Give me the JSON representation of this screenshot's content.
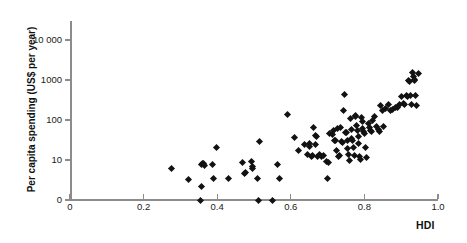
{
  "chart_data": {
    "type": "scatter",
    "title": "",
    "xlabel": "HDI",
    "ylabel": "Per capita spending (US$ per year)",
    "xlim": [
      0,
      1.0
    ],
    "ylim": [
      0,
      10000
    ],
    "yscale": "log-with-zero-baseline",
    "grid": false,
    "legend": null,
    "xticks": [
      "0",
      "0.2",
      "0.4",
      "0.6",
      "0.8",
      "1.0"
    ],
    "xtick_values": [
      0,
      0.2,
      0.4,
      0.6,
      0.8,
      1.0
    ],
    "yticks": [
      "0",
      "10",
      "100",
      "1000",
      "10 000"
    ],
    "ytick_values": [
      0,
      10,
      100,
      1000,
      10000
    ],
    "marker": "filled-diamond",
    "marker_color": "#121212",
    "axis_color": "#8c8c8c",
    "n_points": 120,
    "points": [
      {
        "x": 0.276,
        "y": 6.3
      },
      {
        "x": 0.322,
        "y": 3.3
      },
      {
        "x": 0.355,
        "y": 0
      },
      {
        "x": 0.357,
        "y": 7.6
      },
      {
        "x": 0.36,
        "y": 8.0
      },
      {
        "x": 0.364,
        "y": 8.2
      },
      {
        "x": 0.366,
        "y": 7.4
      },
      {
        "x": 0.357,
        "y": 2.2
      },
      {
        "x": 0.388,
        "y": 7.7
      },
      {
        "x": 0.391,
        "y": 3.4
      },
      {
        "x": 0.398,
        "y": 20.0
      },
      {
        "x": 0.432,
        "y": 3.4
      },
      {
        "x": 0.47,
        "y": 8.8
      },
      {
        "x": 0.474,
        "y": 4.6
      },
      {
        "x": 0.478,
        "y": 4.9
      },
      {
        "x": 0.492,
        "y": 9.0
      },
      {
        "x": 0.495,
        "y": 7.0
      },
      {
        "x": 0.497,
        "y": 6.3
      },
      {
        "x": 0.51,
        "y": 3.4
      },
      {
        "x": 0.512,
        "y": 0
      },
      {
        "x": 0.515,
        "y": 29.0
      },
      {
        "x": 0.551,
        "y": 0
      },
      {
        "x": 0.565,
        "y": 7.8
      },
      {
        "x": 0.568,
        "y": 3.4
      },
      {
        "x": 0.59,
        "y": 140.0
      },
      {
        "x": 0.611,
        "y": 37.0
      },
      {
        "x": 0.62,
        "y": 17.5
      },
      {
        "x": 0.637,
        "y": 24.5
      },
      {
        "x": 0.645,
        "y": 13.5
      },
      {
        "x": 0.65,
        "y": 26.0
      },
      {
        "x": 0.652,
        "y": 22.0
      },
      {
        "x": 0.655,
        "y": 12.5
      },
      {
        "x": 0.66,
        "y": 13.0
      },
      {
        "x": 0.663,
        "y": 66.0
      },
      {
        "x": 0.666,
        "y": 41.0
      },
      {
        "x": 0.668,
        "y": 24.0
      },
      {
        "x": 0.67,
        "y": 39.0
      },
      {
        "x": 0.673,
        "y": 12.0
      },
      {
        "x": 0.678,
        "y": 14.0
      },
      {
        "x": 0.683,
        "y": 12.5
      },
      {
        "x": 0.69,
        "y": 13.0
      },
      {
        "x": 0.698,
        "y": 9.0
      },
      {
        "x": 0.7,
        "y": 3.4
      },
      {
        "x": 0.703,
        "y": 8.7
      },
      {
        "x": 0.706,
        "y": 45.0
      },
      {
        "x": 0.712,
        "y": 43.0
      },
      {
        "x": 0.716,
        "y": 55.0
      },
      {
        "x": 0.72,
        "y": 30.0
      },
      {
        "x": 0.722,
        "y": 31.0
      },
      {
        "x": 0.724,
        "y": 17.0
      },
      {
        "x": 0.728,
        "y": 63.0
      },
      {
        "x": 0.73,
        "y": 12.5
      },
      {
        "x": 0.733,
        "y": 13.0
      },
      {
        "x": 0.736,
        "y": 66.0
      },
      {
        "x": 0.739,
        "y": 29.0
      },
      {
        "x": 0.741,
        "y": 27.0
      },
      {
        "x": 0.744,
        "y": 175.0
      },
      {
        "x": 0.746,
        "y": 430.0
      },
      {
        "x": 0.749,
        "y": 48.0
      },
      {
        "x": 0.751,
        "y": 50.0
      },
      {
        "x": 0.753,
        "y": 31.0
      },
      {
        "x": 0.755,
        "y": 19.0
      },
      {
        "x": 0.757,
        "y": 14.0
      },
      {
        "x": 0.759,
        "y": 9.8
      },
      {
        "x": 0.762,
        "y": 112.0
      },
      {
        "x": 0.764,
        "y": 58.0
      },
      {
        "x": 0.766,
        "y": 34.0
      },
      {
        "x": 0.768,
        "y": 30.0
      },
      {
        "x": 0.77,
        "y": 21.0
      },
      {
        "x": 0.772,
        "y": 13.0
      },
      {
        "x": 0.775,
        "y": 130.0
      },
      {
        "x": 0.777,
        "y": 120.0
      },
      {
        "x": 0.779,
        "y": 74.0
      },
      {
        "x": 0.781,
        "y": 55.0
      },
      {
        "x": 0.783,
        "y": 38.0
      },
      {
        "x": 0.785,
        "y": 26.0
      },
      {
        "x": 0.787,
        "y": 12.0
      },
      {
        "x": 0.789,
        "y": 10.5
      },
      {
        "x": 0.792,
        "y": 118.0
      },
      {
        "x": 0.794,
        "y": 92.0
      },
      {
        "x": 0.796,
        "y": 61.0
      },
      {
        "x": 0.798,
        "y": 52.0
      },
      {
        "x": 0.8,
        "y": 45.0
      },
      {
        "x": 0.803,
        "y": 20.0
      },
      {
        "x": 0.806,
        "y": 11.5
      },
      {
        "x": 0.81,
        "y": 80.0
      },
      {
        "x": 0.813,
        "y": 65.0
      },
      {
        "x": 0.817,
        "y": 56.0
      },
      {
        "x": 0.82,
        "y": 51.0
      },
      {
        "x": 0.823,
        "y": 100.0
      },
      {
        "x": 0.828,
        "y": 120.0
      },
      {
        "x": 0.833,
        "y": 70.0
      },
      {
        "x": 0.837,
        "y": 57.0
      },
      {
        "x": 0.841,
        "y": 52.0
      },
      {
        "x": 0.845,
        "y": 230.0
      },
      {
        "x": 0.848,
        "y": 175.0
      },
      {
        "x": 0.852,
        "y": 70.0
      },
      {
        "x": 0.858,
        "y": 190.0
      },
      {
        "x": 0.865,
        "y": 240.0
      },
      {
        "x": 0.871,
        "y": 175.0
      },
      {
        "x": 0.877,
        "y": 185.0
      },
      {
        "x": 0.884,
        "y": 200.0
      },
      {
        "x": 0.89,
        "y": 210.0
      },
      {
        "x": 0.896,
        "y": 250.0
      },
      {
        "x": 0.902,
        "y": 380.0
      },
      {
        "x": 0.906,
        "y": 265.0
      },
      {
        "x": 0.91,
        "y": 240.0
      },
      {
        "x": 0.914,
        "y": 420.0
      },
      {
        "x": 0.917,
        "y": 395.0
      },
      {
        "x": 0.92,
        "y": 1000.0
      },
      {
        "x": 0.922,
        "y": 900.0
      },
      {
        "x": 0.925,
        "y": 410.0
      },
      {
        "x": 0.928,
        "y": 245.0
      },
      {
        "x": 0.931,
        "y": 1500.0
      },
      {
        "x": 0.933,
        "y": 1250.0
      },
      {
        "x": 0.935,
        "y": 1020.0
      },
      {
        "x": 0.937,
        "y": 960.0
      },
      {
        "x": 0.939,
        "y": 400.0
      },
      {
        "x": 0.941,
        "y": 230.0
      },
      {
        "x": 0.948,
        "y": 1480.0
      }
    ]
  },
  "axes": {
    "y_title": "Per capita spending (US$ per year)",
    "x_title": "HDI"
  },
  "watermarks": {
    "line1": "",
    "line2": "",
    "line3": ""
  }
}
